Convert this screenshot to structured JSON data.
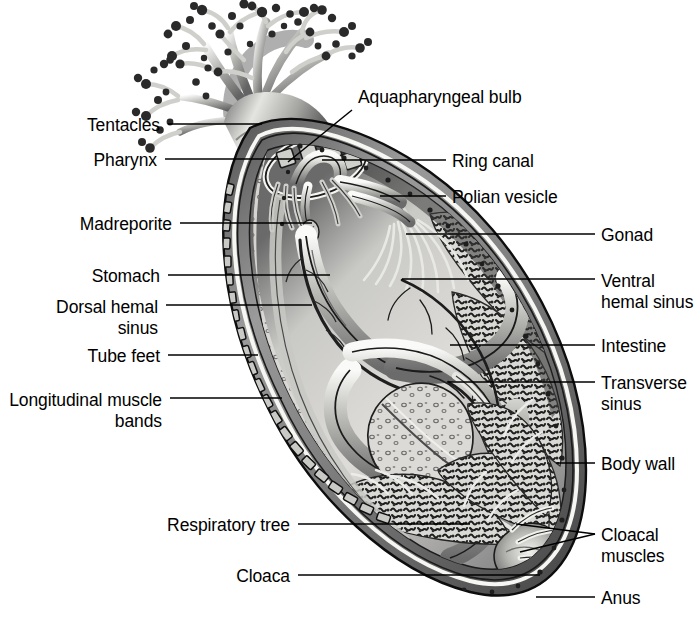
{
  "figure": {
    "background_color": "#ffffff",
    "line_color": "#000000",
    "text_color": "#000000",
    "width": 696,
    "height": 623
  },
  "labels_left": [
    {
      "id": "tentacles",
      "text": "Tentacles",
      "text_x": 160,
      "text_y": 130,
      "leader": [
        [
          168,
          124
        ],
        [
          262,
          124
        ]
      ]
    },
    {
      "id": "pharynx",
      "text": "Pharynx",
      "text_x": 157,
      "text_y": 165,
      "leader": [
        [
          165,
          159
        ],
        [
          300,
          159
        ]
      ]
    },
    {
      "id": "madreporite",
      "text": "Madreporite",
      "text_x": 172,
      "text_y": 229,
      "leader": [
        [
          180,
          223
        ],
        [
          312,
          223
        ]
      ]
    },
    {
      "id": "stomach",
      "text": "Stomach",
      "text_x": 160,
      "text_y": 281,
      "leader": [
        [
          168,
          275
        ],
        [
          330,
          275
        ]
      ]
    },
    {
      "id": "dorsal-hemal-sinus",
      "text": "Dorsal hemal\nsinus",
      "text_x": 158,
      "text_y": 312,
      "leader": [
        [
          166,
          305
        ],
        [
          312,
          305
        ]
      ]
    },
    {
      "id": "tube-feet",
      "text": "Tube feet",
      "text_x": 160,
      "text_y": 361,
      "leader": [
        [
          168,
          355
        ],
        [
          258,
          355
        ]
      ]
    },
    {
      "id": "longitudinal-muscle-bands",
      "text": "Longitudinal muscle\nbands",
      "text_x": 162,
      "text_y": 405,
      "leader": [
        [
          170,
          398
        ],
        [
          282,
          398
        ]
      ]
    },
    {
      "id": "respiratory-tree",
      "text": "Respiratory tree",
      "text_x": 290,
      "text_y": 530,
      "leader": [
        [
          298,
          524
        ],
        [
          470,
          524
        ]
      ]
    },
    {
      "id": "cloaca",
      "text": "Cloaca",
      "text_x": 290,
      "text_y": 581,
      "leader": [
        [
          298,
          575
        ],
        [
          540,
          575
        ]
      ]
    }
  ],
  "labels_right": [
    {
      "id": "aquapharyngeal-bulb",
      "text": "Aquapharyngeal bulb",
      "text_x": 358,
      "text_y": 102,
      "leader": [
        [
          352,
          110
        ],
        [
          288,
          162
        ]
      ]
    },
    {
      "id": "ring-canal",
      "text": "Ring canal",
      "text_x": 452,
      "text_y": 166,
      "leader": [
        [
          446,
          160
        ],
        [
          322,
          160
        ]
      ]
    },
    {
      "id": "polian-vesicle",
      "text": "Polian vesicle",
      "text_x": 452,
      "text_y": 202,
      "leader": [
        [
          446,
          196
        ],
        [
          380,
          196
        ]
      ]
    },
    {
      "id": "gonad",
      "text": "Gonad",
      "text_x": 601,
      "text_y": 240,
      "leader": [
        [
          595,
          234
        ],
        [
          406,
          234
        ]
      ]
    },
    {
      "id": "ventral-hemal-sinus",
      "text": "Ventral\nhemal sinus",
      "text_x": 601,
      "text_y": 286,
      "leader": [
        [
          595,
          279
        ],
        [
          402,
          279
        ]
      ]
    },
    {
      "id": "intestine",
      "text": "Intestine",
      "text_x": 601,
      "text_y": 351,
      "leader": [
        [
          595,
          345
        ],
        [
          450,
          345
        ]
      ]
    },
    {
      "id": "transverse-sinus",
      "text": "Transverse\nsinus",
      "text_x": 601,
      "text_y": 388,
      "leader": [
        [
          595,
          382
        ],
        [
          448,
          382
        ]
      ]
    },
    {
      "id": "body-wall",
      "text": "Body wall",
      "text_x": 601,
      "text_y": 469,
      "leader": [
        [
          595,
          463
        ],
        [
          556,
          463
        ]
      ]
    },
    {
      "id": "cloacal-muscles",
      "text": "Cloacal\nmuscles",
      "text_x": 601,
      "text_y": 540,
      "leader_a": [
        [
          595,
          534
        ],
        [
          516,
          524
        ]
      ],
      "leader_b": [
        [
          595,
          534
        ],
        [
          520,
          552
        ]
      ]
    },
    {
      "id": "anus",
      "text": "Anus",
      "text_x": 601,
      "text_y": 603,
      "leader": [
        [
          595,
          597
        ],
        [
          536,
          597
        ]
      ]
    }
  ],
  "structures": {
    "body_outline": "elongate oval sea cucumber body, tilted, upper-left oral end with branched tentacles, lower-right aboral end",
    "tentacle_crown": "dendritic branched feeding tentacles at the oral end, upper-left",
    "body_wall": "thick outer wall, double outline with pale inner lining",
    "tube_feet": "comb-like podia rows along the ventral (lower-left) body wall",
    "gonad": "mottled tufted mass along the upper-right interior",
    "respiratory_tree": "finely branched arborescent organ in the lower body leading to the cloaca",
    "intestine": "coiled looping gut tube in the mid-body",
    "cloaca": "terminal chamber at the aboral end opening at the anus"
  }
}
